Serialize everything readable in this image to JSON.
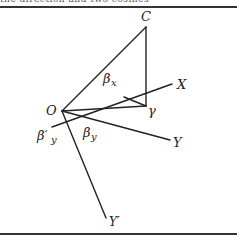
{
  "figure": {
    "top_text_cropped": "the direction and two cosines",
    "stroke_color": "#222222",
    "points": {
      "O": {
        "x": 62,
        "y": 111
      },
      "C": {
        "x": 146,
        "y": 27
      },
      "gamma": {
        "x": 146,
        "y": 106
      },
      "X_end": {
        "x": 172,
        "y": 84
      },
      "X_start": {
        "x": 52,
        "y": 115
      },
      "Y_end": {
        "x": 170,
        "y": 140
      },
      "Yprime_end": {
        "x": 106,
        "y": 218
      },
      "bar_start": {
        "x": 124,
        "y": 97
      }
    },
    "labels": {
      "C": "C",
      "O": "O",
      "X": "X",
      "Y": "Y",
      "Yprime": "Y′",
      "gamma": "γ",
      "beta_x": "β",
      "beta_x_sub": "x",
      "beta_y": "β",
      "beta_y_sub": "y",
      "beta_prime_y": "β′",
      "beta_prime_y_sub": "y"
    }
  }
}
